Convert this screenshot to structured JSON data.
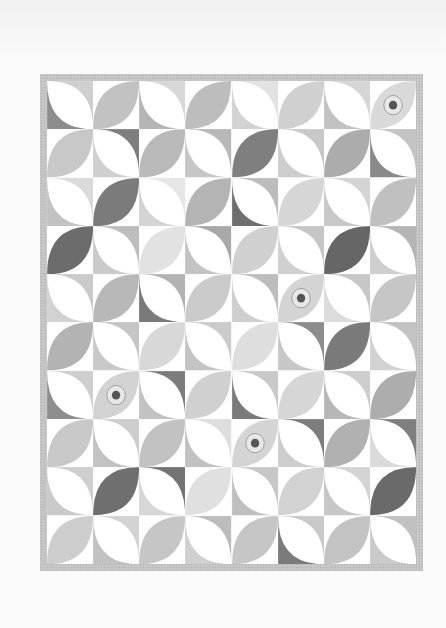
{
  "photo": {
    "subject": "Orange peel pattern quilt",
    "background_color": "#fbfbfb",
    "border_color": "#c6c6c6",
    "grid": {
      "columns": 8,
      "rows": 10
    }
  },
  "blocks": [
    [
      {
        "type": "white-petal",
        "tr": "#cfcfcf",
        "bl": "#8d8d8d"
      },
      {
        "type": "color-petal",
        "fill": "#c2c2c2"
      },
      {
        "type": "white-petal",
        "tr": "#d8d8d8",
        "bl": "#b5b5b5"
      },
      {
        "type": "color-petal",
        "fill": "#bdbdbd"
      },
      {
        "type": "white-petal",
        "tr": "#e2e2e2",
        "bl": "#d2d2d2"
      },
      {
        "type": "color-petal",
        "fill": "#d0d0d0"
      },
      {
        "type": "white-petal",
        "tr": "#d6d6d6",
        "bl": "#c2c2c2"
      },
      {
        "type": "color-petal",
        "fill": "#d9d9d9",
        "motif": "sunflower"
      }
    ],
    [
      {
        "type": "color-petal",
        "fill": "#c8c8c8"
      },
      {
        "type": "white-petal",
        "tr": "#7e7e7e",
        "bl": "#cfcfcf"
      },
      {
        "type": "color-petal",
        "fill": "#b9b9b9"
      },
      {
        "type": "white-petal",
        "tr": "#b8b8b8",
        "bl": "#c6c6c6"
      },
      {
        "type": "color-petal",
        "fill": "#7f7f7f"
      },
      {
        "type": "white-petal",
        "tr": "#c8c8c8",
        "bl": "#cdcdcd"
      },
      {
        "type": "color-petal",
        "fill": "#acacac"
      },
      {
        "type": "white-petal",
        "tr": "#c4c4c4",
        "bl": "#8a8a8a"
      }
    ],
    [
      {
        "type": "white-petal",
        "tr": "#dadada",
        "bl": "#c2c2c2"
      },
      {
        "type": "color-petal",
        "fill": "#7b7b7b"
      },
      {
        "type": "white-petal",
        "tr": "#e6e6e6",
        "bl": "#d4d4d4"
      },
      {
        "type": "color-petal",
        "fill": "#b4b4b4"
      },
      {
        "type": "white-petal",
        "tr": "#bcbcbc",
        "bl": "#6f6f6f"
      },
      {
        "type": "color-petal",
        "fill": "#d6d6d6"
      },
      {
        "type": "white-petal",
        "tr": "#d4d4d4",
        "bl": "#c8c8c8"
      },
      {
        "type": "color-petal",
        "fill": "#c0c0c0"
      }
    ],
    [
      {
        "type": "color-petal",
        "fill": "#6c6c6c"
      },
      {
        "type": "white-petal",
        "tr": "#bdbdbd",
        "bl": "#cacaca"
      },
      {
        "type": "color-petal",
        "fill": "#e2e2e2"
      },
      {
        "type": "white-petal",
        "tr": "#a8a8a8",
        "bl": "#c3c3c3"
      },
      {
        "type": "color-petal",
        "fill": "#d0d0d0"
      },
      {
        "type": "white-petal",
        "tr": "#c6c6c6",
        "bl": "#d0d0d0"
      },
      {
        "type": "color-petal",
        "fill": "#666666"
      },
      {
        "type": "white-petal",
        "tr": "#b5b5b5",
        "bl": "#cfcfcf"
      }
    ],
    [
      {
        "type": "white-petal",
        "tr": "#cacaca",
        "bl": "#d2d2d2"
      },
      {
        "type": "color-petal",
        "fill": "#b8b8b8"
      },
      {
        "type": "white-petal",
        "tr": "#b2b2b2",
        "bl": "#7a7a7a"
      },
      {
        "type": "color-petal",
        "fill": "#cbcbcb"
      },
      {
        "type": "white-petal",
        "tr": "#bdbdbd",
        "bl": "#cecece"
      },
      {
        "type": "color-petal",
        "fill": "#d4d4d4",
        "motif": "sunflower"
      },
      {
        "type": "white-petal",
        "tr": "#c7c7c7",
        "bl": "#dcdcdc"
      },
      {
        "type": "color-petal",
        "fill": "#c6c6c6"
      }
    ],
    [
      {
        "type": "color-petal",
        "fill": "#b3b3b3"
      },
      {
        "type": "white-petal",
        "tr": "#c6c6c6",
        "bl": "#c9c9c9"
      },
      {
        "type": "color-petal",
        "fill": "#d8d8d8"
      },
      {
        "type": "white-petal",
        "tr": "#cbcbcb",
        "bl": "#c4c4c4"
      },
      {
        "type": "color-petal",
        "fill": "#dedede"
      },
      {
        "type": "white-petal",
        "tr": "#8d8d8d",
        "bl": "#c7c7c7"
      },
      {
        "type": "color-petal",
        "fill": "#7a7a7a"
      },
      {
        "type": "white-petal",
        "tr": "#c3c3c3",
        "bl": "#d2d2d2"
      }
    ],
    [
      {
        "type": "white-petal",
        "tr": "#cecece",
        "bl": "#8e8e8e"
      },
      {
        "type": "color-petal",
        "fill": "#d2d2d2",
        "motif": "sunflower"
      },
      {
        "type": "white-petal",
        "tr": "#7c7c7c",
        "bl": "#c2c2c2"
      },
      {
        "type": "color-petal",
        "fill": "#d0d0d0"
      },
      {
        "type": "white-petal",
        "tr": "#c9c9c9",
        "bl": "#7a7a7a"
      },
      {
        "type": "color-petal",
        "fill": "#d6d6d6"
      },
      {
        "type": "white-petal",
        "tr": "#cdcdcd",
        "bl": "#b7b7b7"
      },
      {
        "type": "color-petal",
        "fill": "#adadad"
      }
    ],
    [
      {
        "type": "color-petal",
        "fill": "#c8c8c8"
      },
      {
        "type": "white-petal",
        "tr": "#cdcdcd",
        "bl": "#c3c3c3"
      },
      {
        "type": "color-petal",
        "fill": "#c2c2c2"
      },
      {
        "type": "white-petal",
        "tr": "#dedede",
        "bl": "#c1c1c1"
      },
      {
        "type": "color-petal",
        "fill": "#d4d4d4",
        "motif": "sunflower"
      },
      {
        "type": "white-petal",
        "tr": "#7d7d7d",
        "bl": "#cdcdcd"
      },
      {
        "type": "color-petal",
        "fill": "#b1b1b1"
      },
      {
        "type": "white-petal",
        "tr": "#7f7f7f",
        "bl": "#dadada"
      }
    ],
    [
      {
        "type": "white-petal",
        "tr": "#cfcfcf",
        "bl": "#cacaca"
      },
      {
        "type": "color-petal",
        "fill": "#6f6f6f"
      },
      {
        "type": "white-petal",
        "tr": "#737373",
        "bl": "#d7d7d7"
      },
      {
        "type": "color-petal",
        "fill": "#e0e0e0"
      },
      {
        "type": "white-petal",
        "tr": "#c7c7c7",
        "bl": "#bfbfbf"
      },
      {
        "type": "color-petal",
        "fill": "#d2d2d2"
      },
      {
        "type": "white-petal",
        "tr": "#d4d4d4",
        "bl": "#c6c6c6"
      },
      {
        "type": "color-petal",
        "fill": "#6a6a6a"
      }
    ],
    [
      {
        "type": "color-petal",
        "fill": "#cdcdcd"
      },
      {
        "type": "white-petal",
        "tr": "#d3d3d3",
        "bl": "#c2c2c2"
      },
      {
        "type": "color-petal",
        "fill": "#c6c6c6"
      },
      {
        "type": "white-petal",
        "tr": "#bcbcbc",
        "bl": "#d0d0d0"
      },
      {
        "type": "color-petal",
        "fill": "#c6c6c6"
      },
      {
        "type": "white-petal",
        "tr": "#c9c9c9",
        "bl": "#7b7b7b"
      },
      {
        "type": "color-petal",
        "fill": "#c3c3c3"
      },
      {
        "type": "white-petal",
        "tr": "#c1c1c1",
        "bl": "#cacaca"
      }
    ]
  ]
}
